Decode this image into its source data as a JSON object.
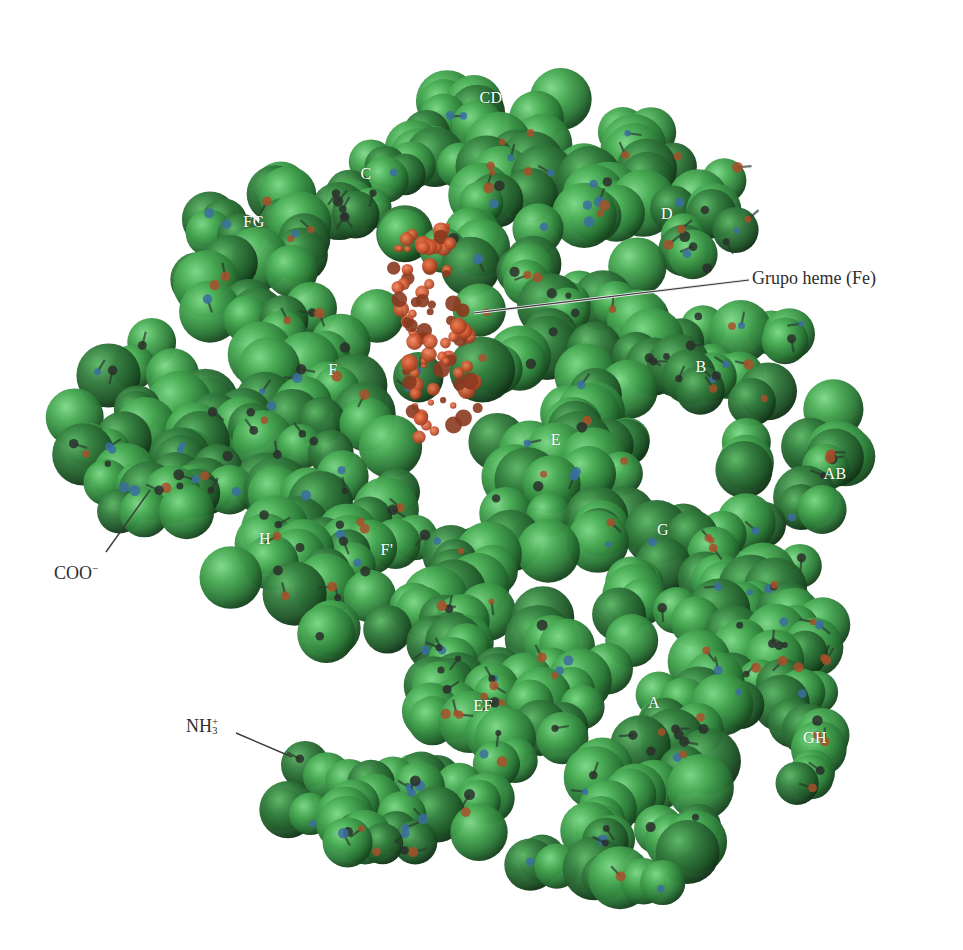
{
  "figure": {
    "colors": {
      "background": "#ffffff",
      "protein_light": "#5fc46a",
      "protein_mid": "#3f9a4a",
      "protein_dark": "#1f5a2a",
      "backbone_carbon": "#2a2f2c",
      "backbone_nitrogen": "#3b6fa0",
      "backbone_oxygen": "#a8502a",
      "heme": "#d2572e",
      "heme_dark": "#8a3a20",
      "label_text_white": "#ffffff",
      "callout_text": "#2e2e2e",
      "leader_line": "#3a3a3a"
    },
    "helix_labels": [
      {
        "id": "CD",
        "text": "CD",
        "x": 491,
        "y": 98
      },
      {
        "id": "C",
        "text": "C",
        "x": 366,
        "y": 174
      },
      {
        "id": "D",
        "text": "D",
        "x": 667,
        "y": 214
      },
      {
        "id": "FG",
        "text": "FG",
        "x": 254,
        "y": 222
      },
      {
        "id": "F",
        "text": "F",
        "x": 333,
        "y": 370
      },
      {
        "id": "B",
        "text": "B",
        "x": 701,
        "y": 367
      },
      {
        "id": "E",
        "text": "E",
        "x": 556,
        "y": 440
      },
      {
        "id": "AB",
        "text": "AB",
        "x": 835,
        "y": 474
      },
      {
        "id": "G",
        "text": "G",
        "x": 663,
        "y": 530
      },
      {
        "id": "H",
        "text": "H",
        "x": 265,
        "y": 539
      },
      {
        "id": "F_prime",
        "text": "F'",
        "x": 387,
        "y": 550
      },
      {
        "id": "EF",
        "text": "EF",
        "x": 483,
        "y": 706
      },
      {
        "id": "A",
        "text": "A",
        "x": 654,
        "y": 703
      },
      {
        "id": "GH",
        "text": "GH",
        "x": 815,
        "y": 738
      }
    ],
    "callouts": {
      "heme": {
        "text": "Grupo heme (Fe)",
        "x": 752,
        "y": 268,
        "line": [
          [
            474,
            313
          ],
          [
            749,
            280
          ]
        ]
      },
      "cooh": {
        "text_main": "COO",
        "text_sup": "−",
        "x": 54,
        "y": 562,
        "line": [
          [
            106,
            552
          ],
          [
            150,
            490
          ]
        ]
      },
      "nh3": {
        "text_main": "NH",
        "text_sup": "+",
        "text_sub": "3",
        "x": 186,
        "y": 717,
        "line": [
          [
            236,
            733
          ],
          [
            292,
            757
          ]
        ]
      }
    }
  }
}
